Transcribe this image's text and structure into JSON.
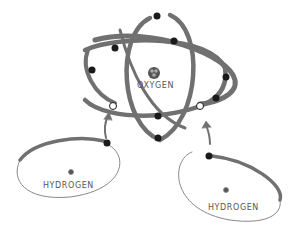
{
  "diagram": {
    "type": "molecular-orbital-illustration",
    "atoms": [
      {
        "id": "oxygen",
        "label": "OXYGEN"
      },
      {
        "id": "hydrogen-left",
        "label": "HYDROGEN"
      },
      {
        "id": "hydrogen-right",
        "label": "HYDROGEN"
      }
    ],
    "colors": {
      "orbit": "#707070",
      "orbit_thin": "#888888",
      "electron": "#1a1a1a",
      "shared_electron": "#ffffff",
      "text": "#555555",
      "nucleus": "#444444"
    }
  }
}
